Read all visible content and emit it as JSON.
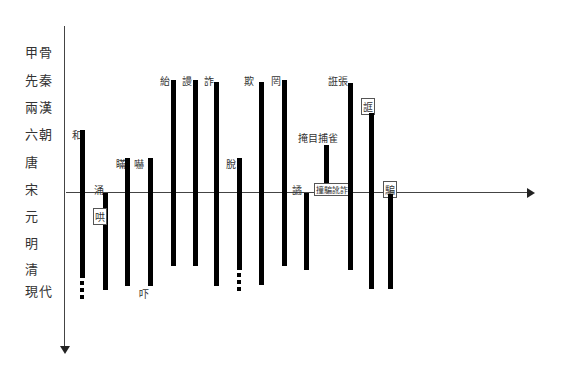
{
  "caption": "",
  "axes": {
    "y_axis_label": "time periods (downward)",
    "x_axis_label": "baseline (宋)"
  },
  "periods": [
    "甲骨",
    "先秦",
    "兩漢",
    "六朝",
    "唐",
    "宋",
    "元",
    "明",
    "清",
    "現代"
  ],
  "words": [
    {
      "label": "和",
      "boxed": false,
      "start": "六朝",
      "end": "清",
      "continues": true
    },
    {
      "label": "涌",
      "boxed": false,
      "start": "宋",
      "end": "現代",
      "continues": false
    },
    {
      "label": "哄",
      "boxed": true,
      "start": "元",
      "end": "",
      "continues": false
    },
    {
      "label": "瞞",
      "boxed": false,
      "start": "唐",
      "end": "現代",
      "continues": false
    },
    {
      "label": "嚇",
      "boxed": false,
      "start": "唐",
      "end": "現代",
      "continues": false
    },
    {
      "label": "吓",
      "boxed": false,
      "start": "現代",
      "end": "",
      "continues": false
    },
    {
      "label": "紿",
      "boxed": false,
      "start": "先秦",
      "end": "清",
      "continues": false
    },
    {
      "label": "謾",
      "boxed": false,
      "start": "先秦",
      "end": "清",
      "continues": false
    },
    {
      "label": "詐",
      "boxed": false,
      "start": "先秦",
      "end": "現代",
      "continues": false
    },
    {
      "label": "脫",
      "boxed": false,
      "start": "唐",
      "end": "清",
      "continues": true
    },
    {
      "label": "欺",
      "boxed": false,
      "start": "先秦",
      "end": "現代",
      "continues": false
    },
    {
      "label": "罔",
      "boxed": false,
      "start": "先秦",
      "end": "清",
      "continues": false
    },
    {
      "label": "譎",
      "boxed": false,
      "start": "宋",
      "end": "清",
      "continues": false
    },
    {
      "label": "掩目捕雀",
      "boxed": false,
      "start": "六朝",
      "end": "宋",
      "continues": false
    },
    {
      "label": "撞騙訛詐",
      "boxed": true,
      "start": "宋",
      "end": "",
      "continues": false
    },
    {
      "label": "誑張",
      "boxed": false,
      "start": "先秦",
      "end": "清",
      "continues": false
    },
    {
      "label": "誆",
      "boxed": true,
      "start": "兩漢",
      "end": "現代",
      "continues": false
    },
    {
      "label": "騙",
      "boxed": true,
      "start": "宋",
      "end": "現代",
      "continues": false
    }
  ]
}
